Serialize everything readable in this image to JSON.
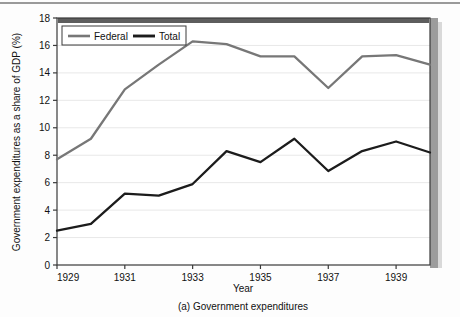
{
  "figure": {
    "caption": "(a) Government expenditures"
  },
  "chart_data": {
    "type": "line",
    "title": "",
    "xlabel": "Year",
    "ylabel": "Government expenditures as a share of GDP (%)",
    "x": [
      1929,
      1930,
      1931,
      1932,
      1933,
      1934,
      1935,
      1936,
      1937,
      1938,
      1939,
      1940
    ],
    "xlim": [
      1929,
      1940
    ],
    "ylim": [
      0,
      18
    ],
    "xticks": [
      1929,
      1931,
      1933,
      1935,
      1937,
      1939
    ],
    "xticklabels": [
      "1929",
      "1931",
      "1933",
      "1935",
      "1937",
      "1939"
    ],
    "yticks": [
      0,
      2,
      4,
      6,
      8,
      10,
      12,
      14,
      16,
      18
    ],
    "yticklabels": [
      "0",
      "2",
      "4",
      "6",
      "8",
      "10",
      "12",
      "14",
      "16",
      "18"
    ],
    "grid": "horizontal",
    "legend_position": "upper left",
    "series": [
      {
        "name": "Federal",
        "color": "#777777",
        "values": [
          7.7,
          9.2,
          12.8,
          14.6,
          16.3,
          16.1,
          15.2,
          15.2,
          12.9,
          15.2,
          15.3,
          14.6
        ]
      },
      {
        "name": "Total",
        "color": "#1c1c1c",
        "values": [
          2.5,
          3.0,
          5.2,
          5.05,
          5.9,
          8.3,
          7.5,
          9.2,
          6.85,
          8.3,
          9.0,
          8.2
        ]
      }
    ]
  },
  "colors": {
    "federal": "#777777",
    "total": "#1c1c1c",
    "axis": "#3a3a3a",
    "grid": "#e8e8e8",
    "shadow": "#6f6f6f"
  }
}
